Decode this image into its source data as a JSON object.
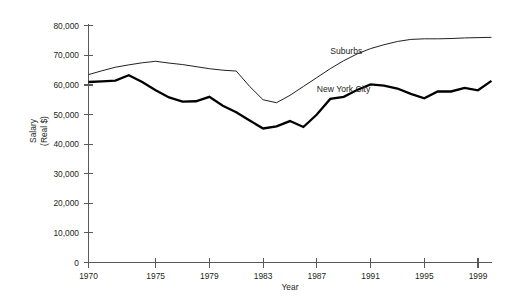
{
  "chart_data": {
    "type": "line",
    "title": "",
    "xlabel": "Year",
    "ylabel": "Salary\n(Real $)",
    "ylabel_line1": "Salary",
    "ylabel_line2": "(Real $)",
    "x": [
      1970,
      1971,
      1972,
      1973,
      1974,
      1975,
      1976,
      1977,
      1978,
      1979,
      1980,
      1981,
      1982,
      1983,
      1984,
      1985,
      1986,
      1987,
      1988,
      1989,
      1990,
      1991,
      1992,
      1993,
      1994,
      1995,
      1996,
      1997,
      1998,
      1999,
      2000
    ],
    "xlim": [
      1970,
      2000
    ],
    "ylim": [
      0,
      80000
    ],
    "xticks": [
      1970,
      1975,
      1979,
      1983,
      1987,
      1991,
      1995,
      1999
    ],
    "xtick_labels": [
      "1970",
      "1975",
      "1979",
      "1983",
      "1987",
      "1991",
      "1995",
      "1999"
    ],
    "yticks": [
      0,
      10000,
      20000,
      30000,
      40000,
      50000,
      60000,
      70000,
      80000
    ],
    "ytick_labels": [
      "0",
      "10,000",
      "20,000",
      "30,000",
      "40,000",
      "50,000",
      "60,000",
      "70,000",
      "80,000"
    ],
    "grid": false,
    "legend_position": "inline-annotations",
    "series": [
      {
        "name": "Suburbs",
        "color": "#231f20",
        "line_width": 1.0,
        "label_x": 1988,
        "label_y": 70500,
        "values": [
          63500,
          64800,
          66000,
          66800,
          67500,
          68000,
          67400,
          66900,
          66200,
          65500,
          65000,
          64700,
          59500,
          55000,
          54000,
          56500,
          59500,
          62500,
          65500,
          68200,
          70500,
          72300,
          73600,
          74700,
          75400,
          75600,
          75600,
          75700,
          75900,
          76000,
          76100
        ]
      },
      {
        "name": "New York City",
        "color": "#000000",
        "line_width": 2.3,
        "label_x": 1987,
        "label_y": 57500,
        "values": [
          61000,
          61200,
          61500,
          63300,
          61000,
          58200,
          55800,
          54400,
          54500,
          56000,
          53000,
          50800,
          48000,
          45300,
          46000,
          47800,
          45800,
          50000,
          55300,
          56000,
          58300,
          60200,
          59800,
          58800,
          57000,
          55500,
          57800,
          57800,
          59000,
          58200,
          61400
        ]
      }
    ],
    "annotations": [
      {
        "text": "Suburbs",
        "x": 1988,
        "y": 70500
      },
      {
        "text": "New York City",
        "x": 1987,
        "y": 57500
      }
    ]
  },
  "axes": {
    "y_title_line1": "Salary",
    "y_title_line2": "(Real $)",
    "x_title": "Year"
  }
}
